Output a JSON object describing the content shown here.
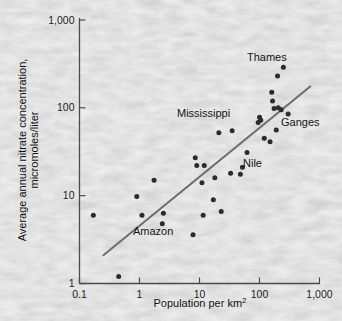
{
  "chart_data": {
    "type": "scatter",
    "title": "",
    "subtitle": "",
    "xlabel": "Population per km",
    "xlabel_superscript": "2",
    "ylabel": "Average annual nitrate concentration, micromoles/liter",
    "xscale": "log",
    "yscale": "log",
    "xlim": [
      0.1,
      1000
    ],
    "ylim": [
      1,
      1000
    ],
    "grid": false,
    "legend": "none",
    "x_ticks": [
      "0.1",
      "1",
      "10",
      "100",
      "1,000"
    ],
    "x_tick_values": [
      0.1,
      1,
      10,
      100,
      1000
    ],
    "y_ticks": [
      "1",
      "10",
      "100",
      "1,000"
    ],
    "y_tick_values": [
      1,
      10,
      100,
      1000
    ],
    "marker_color": "#2b2b2b",
    "line_color": "#6e6e6e",
    "axis_color": "#4a4a4a",
    "background_color": "#d4d4d4",
    "points": [
      {
        "x": 0.17,
        "y": 6.0
      },
      {
        "x": 0.45,
        "y": 1.2
      },
      {
        "x": 0.9,
        "y": 9.8
      },
      {
        "x": 1.1,
        "y": 6.0
      },
      {
        "x": 1.75,
        "y": 15.0
      },
      {
        "x": 2.4,
        "y": 4.8
      },
      {
        "x": 2.5,
        "y": 6.3
      },
      {
        "x": 7.8,
        "y": 3.6
      },
      {
        "x": 8.5,
        "y": 27.0
      },
      {
        "x": 9.0,
        "y": 22.0
      },
      {
        "x": 11.0,
        "y": 14.0
      },
      {
        "x": 11.5,
        "y": 6.0
      },
      {
        "x": 12.0,
        "y": 22.0
      },
      {
        "x": 17.0,
        "y": 9.0
      },
      {
        "x": 18.0,
        "y": 16.0
      },
      {
        "x": 21.0,
        "y": 52.0
      },
      {
        "x": 23.0,
        "y": 6.6
      },
      {
        "x": 33.0,
        "y": 18.0
      },
      {
        "x": 35.0,
        "y": 55.0
      },
      {
        "x": 48.0,
        "y": 17.5
      },
      {
        "x": 52.0,
        "y": 21.0
      },
      {
        "x": 62.0,
        "y": 31.0
      },
      {
        "x": 95.0,
        "y": 68.0
      },
      {
        "x": 100.0,
        "y": 78.0
      },
      {
        "x": 105.0,
        "y": 72.0
      },
      {
        "x": 120.0,
        "y": 45.0
      },
      {
        "x": 150.0,
        "y": 41.0
      },
      {
        "x": 160.0,
        "y": 150.0
      },
      {
        "x": 165.0,
        "y": 120.0
      },
      {
        "x": 175.0,
        "y": 98.0
      },
      {
        "x": 190.0,
        "y": 56.0
      },
      {
        "x": 200.0,
        "y": 230.0
      },
      {
        "x": 205.0,
        "y": 100.0
      },
      {
        "x": 230.0,
        "y": 95.0
      },
      {
        "x": 250.0,
        "y": 290.0
      },
      {
        "x": 300.0,
        "y": 85.0
      }
    ],
    "trend_line": {
      "x_start": 0.25,
      "y_start": 2.1,
      "x_end": 700,
      "y_end": 175
    },
    "annotations": [
      {
        "label": "Thames",
        "x_px": 247,
        "y_px": 61
      },
      {
        "label": "Mississippi",
        "x_px": 177,
        "y_px": 117
      },
      {
        "label": "Ganges",
        "x_px": 281,
        "y_px": 126
      },
      {
        "label": "Nile",
        "x_px": 243,
        "y_px": 167
      },
      {
        "label": "Amazon",
        "x_px": 133,
        "y_px": 235
      }
    ]
  }
}
